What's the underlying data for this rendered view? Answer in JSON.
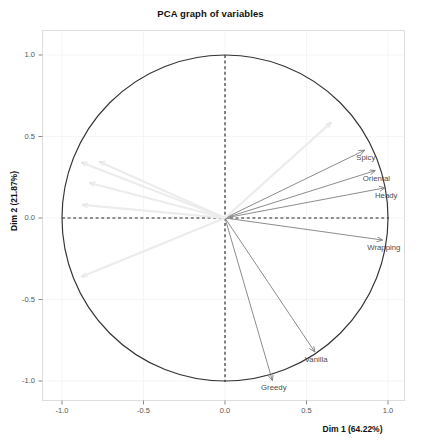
{
  "chart_data": {
    "type": "scatter",
    "title": "PCA graph of variables",
    "xlabel": "Dim 1 (64.22%)",
    "ylabel": "Dim 2 (21.87%)",
    "xlim": [
      -1.12,
      1.12
    ],
    "ylim": [
      -1.12,
      1.12
    ],
    "xticks": [
      "-1.0",
      "-0.5",
      "0.0",
      "0.5",
      "1.0"
    ],
    "xtick_values": [
      -1.0,
      -0.5,
      0.0,
      0.5,
      1.0
    ],
    "yticks": [
      "1.0",
      "0.5",
      "0.0",
      "-0.5",
      "-1.0"
    ],
    "ytick_values": [
      1.0,
      0.5,
      0.0,
      -0.5,
      -1.0
    ],
    "grid": true,
    "legend": "none",
    "correlation_circle_radius": 1.0,
    "annotations": [
      "dashed horizontal reference line at Dim 2 = 0",
      "dashed vertical reference line at Dim 1 = 0",
      "unit correlation circle"
    ],
    "variables": [
      {
        "name": "Spicy",
        "x": 0.855,
        "y": 0.415,
        "label_dx": 0.0,
        "label_dy": -0.06,
        "color": "#777777",
        "labelled": true
      },
      {
        "name": "Oriental",
        "x": 0.92,
        "y": 0.29,
        "label_dx": 0.0,
        "label_dy": -0.06,
        "color": "#777777",
        "labelled": true
      },
      {
        "name": "Heady",
        "x": 0.98,
        "y": 0.185,
        "label_dx": 0.0,
        "label_dy": -0.06,
        "color": "#777777",
        "labelled": true
      },
      {
        "name": "Wrapping",
        "x": 0.965,
        "y": -0.135,
        "label_dx": 0.0,
        "label_dy": -0.06,
        "color": "#777777",
        "labelled": true
      },
      {
        "name": "Vanilla",
        "x": 0.55,
        "y": -0.82,
        "label_dx": 0.0,
        "label_dy": -0.06,
        "color": "#777777",
        "labelled": true
      },
      {
        "name": "Greedy",
        "x": 0.29,
        "y": -0.995,
        "label_dx": 0.0,
        "label_dy": -0.06,
        "color": "#777777",
        "labelled": true
      },
      {
        "name": "unlabelled-1",
        "x": -0.88,
        "y": 0.34,
        "label_dx": 0.0,
        "label_dy": 0.0,
        "color": "#ececec",
        "labelled": false
      },
      {
        "name": "unlabelled-2",
        "x": -0.77,
        "y": 0.345,
        "label_dx": 0.0,
        "label_dy": 0.0,
        "color": "#ececec",
        "labelled": false
      },
      {
        "name": "unlabelled-3",
        "x": -0.83,
        "y": 0.215,
        "label_dx": 0.0,
        "label_dy": 0.0,
        "color": "#ececec",
        "labelled": false
      },
      {
        "name": "unlabelled-4",
        "x": -0.875,
        "y": 0.08,
        "label_dx": 0.0,
        "label_dy": 0.0,
        "color": "#ececec",
        "labelled": false
      },
      {
        "name": "unlabelled-5",
        "x": -0.88,
        "y": -0.36,
        "label_dx": 0.0,
        "label_dy": 0.0,
        "color": "#ececec",
        "labelled": false
      },
      {
        "name": "unlabelled-6",
        "x": 0.65,
        "y": 0.585,
        "label_dx": 0.0,
        "label_dy": 0.0,
        "color": "#ececec",
        "labelled": false
      }
    ]
  },
  "colors": {
    "panel_background": "#ffffff",
    "panel_border": "#dddddd",
    "grid": "#f5f5f5",
    "circle": "#333333",
    "dashed_reference": "#222222",
    "arrow_labelled": "#777777",
    "arrow_unlabelled": "#ececec",
    "text": "#4d4d4d",
    "title_text": "#111111"
  }
}
